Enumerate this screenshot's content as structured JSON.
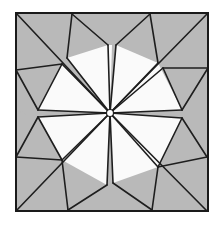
{
  "figure": {
    "title": "Folded square crease pattern",
    "colors": {
      "paper_shaded": "#b9b9b9",
      "paper_white": "#fafafa",
      "line": "#1e1e1e",
      "background": "#ffffff"
    },
    "square": {
      "tl": [
        16,
        13
      ],
      "tr": [
        208,
        13
      ],
      "br": [
        207,
        211
      ],
      "bl": [
        16,
        211
      ]
    },
    "center": [
      110,
      113
    ],
    "white_regions": [
      "67,58 108,45 110,113",
      "108,45 112,45 110,113",
      "38,110 62,64 110,113",
      "116,45 158,63 110,113",
      "158,63 182,110 110,113",
      "38,117 62,160 110,113",
      "62,160 107,185 110,113",
      "113,183 158,167 110,113",
      "158,167 182,118 110,113"
    ],
    "shaded_regions": [
      "16,13 72,14 67,58 110,113 62,64 16,70",
      "72,14 150,14 116,45 110,45 108,45",
      "150,14 208,13 208,68 163,68 110,113 158,63",
      "16,70 62,64 38,110 16,112",
      "208,68 208,157 182,118 182,110 163,68",
      "16,112 38,117 62,160 16,157",
      "16,157 62,160 110,113 107,185 68,210 16,211",
      "68,210 152,210 113,183 110,183 107,185",
      "152,210 207,211 207,157 182,118 158,167 110,113 113,183"
    ],
    "lines": [
      [
        16,
        13,
        110,
        113
      ],
      [
        208,
        13,
        110,
        113
      ],
      [
        16,
        211,
        110,
        113
      ],
      [
        207,
        211,
        110,
        113
      ],
      [
        72,
        14,
        67,
        58
      ],
      [
        72,
        14,
        108,
        45
      ],
      [
        67,
        58,
        110,
        113
      ],
      [
        108,
        45,
        110,
        113
      ],
      [
        16,
        70,
        62,
        64
      ],
      [
        62,
        64,
        38,
        110
      ],
      [
        16,
        70,
        38,
        110
      ],
      [
        38,
        110,
        110,
        113
      ],
      [
        62,
        64,
        110,
        113
      ],
      [
        150,
        14,
        116,
        45
      ],
      [
        150,
        14,
        158,
        63
      ],
      [
        116,
        45,
        110,
        113
      ],
      [
        158,
        63,
        110,
        113
      ],
      [
        208,
        68,
        163,
        68
      ],
      [
        163,
        68,
        182,
        110
      ],
      [
        208,
        68,
        182,
        110
      ],
      [
        182,
        110,
        110,
        113
      ],
      [
        163,
        68,
        110,
        113
      ],
      [
        16,
        157,
        38,
        117
      ],
      [
        16,
        157,
        62,
        160
      ],
      [
        38,
        117,
        62,
        160
      ],
      [
        38,
        117,
        110,
        113
      ],
      [
        62,
        160,
        110,
        113
      ],
      [
        68,
        210,
        62,
        160
      ],
      [
        68,
        210,
        107,
        185
      ],
      [
        107,
        185,
        110,
        113
      ],
      [
        152,
        210,
        113,
        183
      ],
      [
        152,
        210,
        158,
        167
      ],
      [
        113,
        183,
        110,
        113
      ],
      [
        158,
        167,
        110,
        113
      ],
      [
        207,
        157,
        182,
        118
      ],
      [
        207,
        157,
        158,
        167
      ],
      [
        182,
        118,
        158,
        167
      ],
      [
        182,
        118,
        110,
        113
      ]
    ]
  }
}
